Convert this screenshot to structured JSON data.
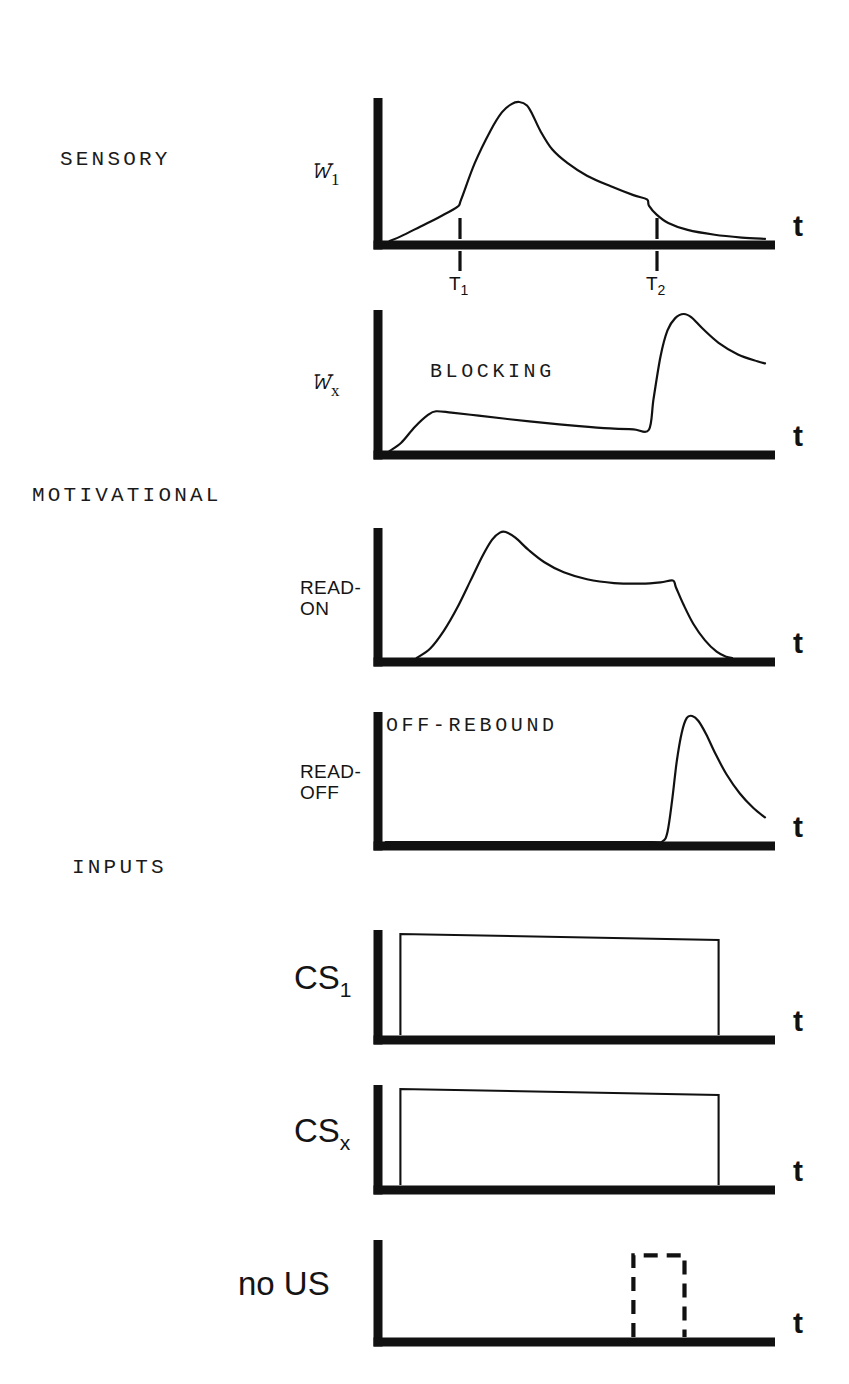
{
  "figure": {
    "title_visible": false,
    "background": "#ffffff",
    "ink": "#111111"
  },
  "groups": [
    {
      "id": "sensory",
      "label": "SENSORY",
      "x": 60,
      "y": 148
    },
    {
      "id": "motivational",
      "label": "MOTIVATIONAL",
      "x": 32,
      "y": 484
    },
    {
      "id": "inputs",
      "label": "INPUTS",
      "x": 72,
      "y": 856
    }
  ],
  "panels": [
    {
      "id": "s1",
      "ylabel": "S",
      "ysub": "1",
      "xlabel": "t",
      "inplot_label": "",
      "axis": {
        "x0": 378,
        "y0": 245,
        "x1": 775,
        "top": 98
      },
      "ticks": [
        {
          "label": "T",
          "sub": "1",
          "x": 460
        },
        {
          "label": "T",
          "sub": "2",
          "x": 657
        }
      ]
    },
    {
      "id": "sx",
      "ylabel": "S",
      "ysub": "x",
      "xlabel": "t",
      "inplot_label": "BLOCKING",
      "axis": {
        "x0": 378,
        "y0": 455,
        "x1": 775,
        "top": 310
      },
      "ticks": []
    },
    {
      "id": "read_on",
      "ylabel": "READ-\nON",
      "ysub": "",
      "xlabel": "t",
      "inplot_label": "",
      "axis": {
        "x0": 378,
        "y0": 662,
        "x1": 775,
        "top": 528
      },
      "ticks": []
    },
    {
      "id": "read_off",
      "ylabel": "READ-\nOFF",
      "ysub": "",
      "xlabel": "t",
      "inplot_label": "OFF-REBOUND",
      "axis": {
        "x0": 378,
        "y0": 846,
        "x1": 775,
        "top": 712
      },
      "ticks": []
    },
    {
      "id": "cs1",
      "ylabel": "CS",
      "ysub": "1",
      "xlabel": "t",
      "inplot_label": "",
      "axis": {
        "x0": 378,
        "y0": 1040,
        "x1": 775,
        "top": 930
      },
      "ticks": []
    },
    {
      "id": "csx",
      "ylabel": "CS",
      "ysub": "x",
      "xlabel": "t",
      "inplot_label": "",
      "axis": {
        "x0": 378,
        "y0": 1190,
        "x1": 775,
        "top": 1085
      },
      "ticks": []
    },
    {
      "id": "no_us",
      "ylabel": "no US",
      "ysub": "",
      "xlabel": "t",
      "inplot_label": "",
      "axis": {
        "x0": 378,
        "y0": 1342,
        "x1": 775,
        "top": 1240
      },
      "ticks": []
    }
  ],
  "chart_data": {
    "type": "line",
    "title": "",
    "xlabel": "t",
    "ylabel": "",
    "grid": false,
    "legend": "none",
    "annotations": [
      "BLOCKING",
      "OFF-REBOUND",
      "SENSORY",
      "MOTIVATIONAL",
      "INPUTS"
    ],
    "event_times": {
      "T1": 0.21,
      "T2": 0.7
    },
    "xlim": [
      0,
      1
    ],
    "ylim": [
      0,
      1
    ],
    "series": [
      {
        "name": "S_1",
        "panel": "s1",
        "ylabel": "S_1",
        "description": "Slow ramp from CS onset, jump at T1 to sharp peak, fast then slow decay with small shoulder at T2",
        "points": [
          [
            0.03,
            0.0
          ],
          [
            0.06,
            0.035
          ],
          [
            0.11,
            0.105
          ],
          [
            0.16,
            0.175
          ],
          [
            0.205,
            0.245
          ],
          [
            0.215,
            0.3
          ],
          [
            0.25,
            0.56
          ],
          [
            0.29,
            0.79
          ],
          [
            0.32,
            0.925
          ],
          [
            0.345,
            0.985
          ],
          [
            0.365,
            1.0
          ],
          [
            0.385,
            0.975
          ],
          [
            0.4,
            0.905
          ],
          [
            0.42,
            0.79
          ],
          [
            0.45,
            0.66
          ],
          [
            0.49,
            0.56
          ],
          [
            0.54,
            0.47
          ],
          [
            0.6,
            0.395
          ],
          [
            0.66,
            0.33
          ],
          [
            0.695,
            0.3
          ],
          [
            0.7,
            0.255
          ],
          [
            0.72,
            0.19
          ],
          [
            0.75,
            0.13
          ],
          [
            0.8,
            0.08
          ],
          [
            0.87,
            0.045
          ],
          [
            0.94,
            0.025
          ],
          [
            1.0,
            0.015
          ]
        ]
      },
      {
        "name": "S_x",
        "panel": "sx",
        "ylabel": "S_x",
        "description": "Small ramp to low plateau, slow decay until T2, then abrupt rise to large peak and decay",
        "points": [
          [
            0.03,
            0.0
          ],
          [
            0.06,
            0.06
          ],
          [
            0.095,
            0.175
          ],
          [
            0.13,
            0.265
          ],
          [
            0.15,
            0.29
          ],
          [
            0.19,
            0.28
          ],
          [
            0.26,
            0.258
          ],
          [
            0.34,
            0.232
          ],
          [
            0.43,
            0.205
          ],
          [
            0.52,
            0.182
          ],
          [
            0.6,
            0.165
          ],
          [
            0.66,
            0.158
          ],
          [
            0.7,
            0.155
          ],
          [
            0.712,
            0.38
          ],
          [
            0.73,
            0.69
          ],
          [
            0.748,
            0.88
          ],
          [
            0.768,
            0.97
          ],
          [
            0.79,
            1.0
          ],
          [
            0.81,
            0.975
          ],
          [
            0.84,
            0.89
          ],
          [
            0.88,
            0.79
          ],
          [
            0.93,
            0.705
          ],
          [
            0.98,
            0.655
          ],
          [
            1.0,
            0.64
          ]
        ]
      },
      {
        "name": "READ-ON",
        "panel": "read_on",
        "ylabel": "READ-ON",
        "description": "Sigmoid rise to overshoot peak, decay to sustained plateau, then sharp fall to zero at offset",
        "points": [
          [
            0.1,
            0.0
          ],
          [
            0.135,
            0.075
          ],
          [
            0.17,
            0.215
          ],
          [
            0.205,
            0.4
          ],
          [
            0.24,
            0.62
          ],
          [
            0.27,
            0.81
          ],
          [
            0.295,
            0.94
          ],
          [
            0.315,
            0.995
          ],
          [
            0.33,
            1.0
          ],
          [
            0.355,
            0.955
          ],
          [
            0.39,
            0.855
          ],
          [
            0.43,
            0.76
          ],
          [
            0.48,
            0.68
          ],
          [
            0.54,
            0.625
          ],
          [
            0.61,
            0.595
          ],
          [
            0.68,
            0.59
          ],
          [
            0.73,
            0.6
          ],
          [
            0.762,
            0.615
          ],
          [
            0.77,
            0.56
          ],
          [
            0.79,
            0.42
          ],
          [
            0.815,
            0.27
          ],
          [
            0.845,
            0.14
          ],
          [
            0.875,
            0.05
          ],
          [
            0.9,
            0.01
          ],
          [
            0.915,
            0.0
          ]
        ]
      },
      {
        "name": "READ-OFF",
        "panel": "read_off",
        "ylabel": "READ-OFF",
        "description": "Flat at zero until CS offset, then rapid rebound peak followed by decay",
        "points": [
          [
            0.02,
            0.0
          ],
          [
            0.4,
            0.0
          ],
          [
            0.7,
            0.0
          ],
          [
            0.735,
            0.005
          ],
          [
            0.748,
            0.08
          ],
          [
            0.76,
            0.33
          ],
          [
            0.772,
            0.64
          ],
          [
            0.785,
            0.87
          ],
          [
            0.798,
            0.985
          ],
          [
            0.812,
            1.0
          ],
          [
            0.828,
            0.96
          ],
          [
            0.848,
            0.855
          ],
          [
            0.872,
            0.7
          ],
          [
            0.9,
            0.54
          ],
          [
            0.935,
            0.385
          ],
          [
            0.97,
            0.27
          ],
          [
            1.0,
            0.195
          ]
        ]
      },
      {
        "name": "CS_1",
        "panel": "cs1",
        "ylabel": "CS_1",
        "type": "pulse",
        "style": "solid",
        "description": "Rectangular pulse, on from CS onset to offset",
        "pulse": {
          "start": 0.058,
          "end": 0.88,
          "height": 1.0
        }
      },
      {
        "name": "CS_x",
        "panel": "csx",
        "ylabel": "CS_x",
        "type": "pulse",
        "style": "solid",
        "description": "Rectangular pulse, on from CS onset to offset, same timing as CS_1",
        "pulse": {
          "start": 0.058,
          "end": 0.88,
          "height": 1.0
        }
      },
      {
        "name": "no US",
        "panel": "no_us",
        "ylabel": "no US",
        "type": "pulse",
        "style": "dashed",
        "description": "Dashed (absent) US pulse at the usual US time",
        "pulse": {
          "start": 0.66,
          "end": 0.792,
          "height": 0.88
        }
      }
    ]
  }
}
